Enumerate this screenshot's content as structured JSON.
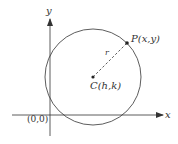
{
  "diagram": {
    "axes": {
      "x_label": "x",
      "y_label": "y",
      "origin_label": "(0,0)"
    },
    "center": {
      "label": "C(h,k)"
    },
    "point": {
      "label": "P(x,y)"
    },
    "radius": {
      "label": "r"
    },
    "colors": {
      "stroke": "#333333",
      "background": "#ffffff"
    }
  }
}
